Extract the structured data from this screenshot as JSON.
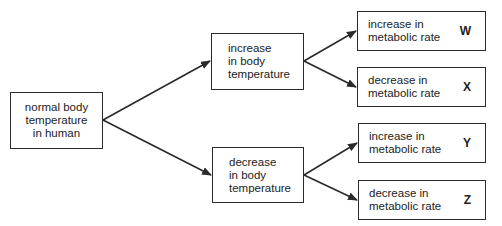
{
  "diagram": {
    "root": {
      "label": "normal body\ntemperature\nin human"
    },
    "branches": [
      {
        "label": "increase\nin body\ntemperature",
        "outcomes": [
          {
            "label": "increase in\nmetabolic rate",
            "letter": "W"
          },
          {
            "label": "decrease in\nmetabolic rate",
            "letter": "X"
          }
        ]
      },
      {
        "label": "decrease\nin body\ntemperature",
        "outcomes": [
          {
            "label": "increase in\nmetabolic rate",
            "letter": "Y"
          },
          {
            "label": "decrease in\nmetabolic rate",
            "letter": "Z"
          }
        ]
      }
    ],
    "colors": {
      "line": "#2a2a2a",
      "background": "#ffffff"
    }
  }
}
